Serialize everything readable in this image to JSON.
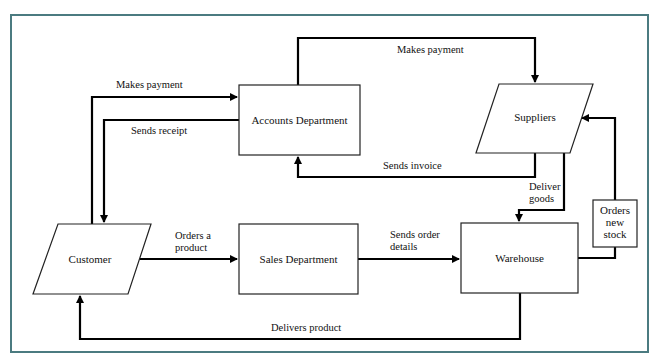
{
  "diagram": {
    "type": "data-flow",
    "frame_color": "#4b7b80",
    "nodes": {
      "accounts": {
        "label": "Accounts Department",
        "shape": "rectangle"
      },
      "suppliers": {
        "label": "Suppliers",
        "shape": "parallelogram"
      },
      "customer": {
        "label": "Customer",
        "shape": "parallelogram"
      },
      "sales": {
        "label": "Sales Department",
        "shape": "rectangle"
      },
      "warehouse": {
        "label": "Warehouse",
        "shape": "rectangle"
      },
      "orders_stock": {
        "lines": [
          "Orders",
          "new",
          "stock"
        ],
        "shape": "rectangle"
      }
    },
    "edges": {
      "customer_to_accounts": {
        "label": "Makes payment",
        "from": "Customer",
        "to": "Accounts Department"
      },
      "accounts_to_customer": {
        "label": "Sends receipt",
        "from": "Accounts Department",
        "to": "Customer"
      },
      "accounts_to_suppliers": {
        "label": "Makes payment",
        "from": "Accounts Department",
        "to": "Suppliers"
      },
      "suppliers_to_accounts": {
        "label": "Sends invoice",
        "from": "Suppliers",
        "to": "Accounts Department"
      },
      "suppliers_to_warehouse": {
        "lines": [
          "Deliver",
          "goods"
        ],
        "from": "Suppliers",
        "to": "Warehouse"
      },
      "customer_to_sales": {
        "lines": [
          "Orders a",
          "product"
        ],
        "from": "Customer",
        "to": "Sales Department"
      },
      "sales_to_warehouse": {
        "lines": [
          "Sends order",
          "details"
        ],
        "from": "Sales Department",
        "to": "Warehouse"
      },
      "warehouse_to_customer": {
        "label": "Delivers product",
        "from": "Warehouse",
        "to": "Customer"
      },
      "warehouse_to_suppliers": {
        "via": "Orders new stock",
        "from": "Warehouse",
        "to": "Suppliers"
      }
    }
  }
}
